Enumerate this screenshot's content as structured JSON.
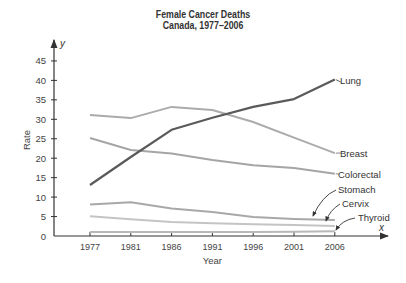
{
  "chart_data": {
    "type": "line",
    "title": "Female Cancer Deaths",
    "subtitle": "Canada, 1977–2006",
    "xlabel": "Year",
    "ylabel": "Rate",
    "x_axis_var": "x",
    "y_axis_var": "y",
    "categories": [
      "1977",
      "1981",
      "1986",
      "1991",
      "1996",
      "2001",
      "2006"
    ],
    "yticks": [
      0,
      5,
      10,
      15,
      20,
      25,
      30,
      35,
      40,
      45
    ],
    "ylim": [
      0,
      48
    ],
    "grid": false,
    "legend_position": "inline-right-labels",
    "series": [
      {
        "name": "Lung",
        "color": "#5a5a5a",
        "values": [
          13.1,
          20.3,
          27.3,
          30.4,
          33.2,
          35.2,
          40.2
        ]
      },
      {
        "name": "Breast",
        "color": "#ababab",
        "values": [
          31.1,
          30.3,
          33.2,
          32.4,
          29.3,
          25.3,
          21.3
        ]
      },
      {
        "name": "Colorectal",
        "color": "#a5a5a5",
        "values": [
          25.2,
          22.1,
          21.2,
          19.5,
          18.2,
          17.5,
          16.0
        ]
      },
      {
        "name": "Stomach",
        "color": "#a8a8a8",
        "values": [
          8.1,
          8.7,
          7.1,
          6.2,
          4.9,
          4.4,
          4.1
        ]
      },
      {
        "name": "Cervix",
        "color": "#c4c4c4",
        "values": [
          5.1,
          4.3,
          3.6,
          3.3,
          3.0,
          2.8,
          2.6
        ]
      },
      {
        "name": "Thyroid",
        "color": "#b8b8b8",
        "values": [
          1.0,
          1.0,
          1.0,
          1.0,
          1.0,
          1.1,
          1.2
        ]
      }
    ]
  }
}
